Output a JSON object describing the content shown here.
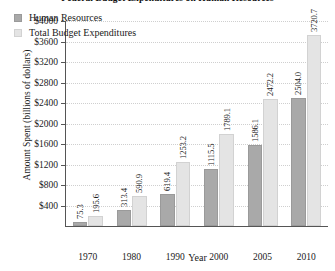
{
  "chart_data": {
    "type": "bar",
    "title": "Federal Budget Expenditures on Human Resources",
    "xlabel": "Year",
    "ylabel": "Amount Spent (billions of dollars)",
    "categories": [
      "1970",
      "1980",
      "1990",
      "2000",
      "2005",
      "2010"
    ],
    "series": [
      {
        "name": "Human Resources",
        "color": "#a9a9a9",
        "values": [
          75.3,
          313.4,
          619.4,
          1115.5,
          1586.1,
          2504.0
        ]
      },
      {
        "name": "Total Budget Expenditures",
        "color": "#e4e4e4",
        "values": [
          195.6,
          590.9,
          1253.2,
          1789.1,
          2472.2,
          3720.7
        ]
      }
    ],
    "ylim": [
      0,
      4000
    ],
    "ytick_labels": [
      "$400",
      "$800",
      "$1200",
      "$1600",
      "$2000",
      "$2400",
      "$2800",
      "$3200",
      "$3600",
      "$4000"
    ],
    "ytick_values": [
      400,
      800,
      1200,
      1600,
      2000,
      2400,
      2800,
      3200,
      3600,
      4000
    ],
    "grid": true,
    "legend_position": "top-left",
    "value_labels_rotated": true
  }
}
